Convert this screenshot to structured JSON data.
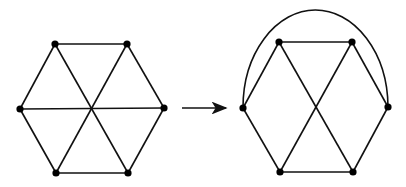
{
  "diagram": {
    "type": "graph-transformation",
    "left_graph": {
      "name": "hexagon-with-diagonals",
      "nodes": [
        {
          "id": "a",
          "x": 55,
          "y": 44
        },
        {
          "id": "b",
          "x": 127,
          "y": 44
        },
        {
          "id": "c",
          "x": 164,
          "y": 108
        },
        {
          "id": "d",
          "x": 128,
          "y": 173
        },
        {
          "id": "e",
          "x": 56,
          "y": 173
        },
        {
          "id": "f",
          "x": 20,
          "y": 109
        }
      ],
      "edges": [
        [
          "a",
          "b"
        ],
        [
          "b",
          "c"
        ],
        [
          "c",
          "d"
        ],
        [
          "d",
          "e"
        ],
        [
          "e",
          "f"
        ],
        [
          "f",
          "a"
        ],
        [
          "a",
          "d"
        ],
        [
          "b",
          "e"
        ],
        [
          "f",
          "c"
        ]
      ]
    },
    "arrow": {
      "x1": 182,
      "y1": 108,
      "x2": 226,
      "y2": 108
    },
    "right_graph": {
      "name": "hexagon-with-cross-and-arc",
      "nodes": [
        {
          "id": "a",
          "x": 279,
          "y": 42
        },
        {
          "id": "b",
          "x": 352,
          "y": 42
        },
        {
          "id": "c",
          "x": 388,
          "y": 107
        },
        {
          "id": "d",
          "x": 353,
          "y": 172
        },
        {
          "id": "e",
          "x": 280,
          "y": 172
        },
        {
          "id": "f",
          "x": 243,
          "y": 108
        }
      ],
      "edges": [
        [
          "a",
          "b"
        ],
        [
          "b",
          "c"
        ],
        [
          "c",
          "d"
        ],
        [
          "d",
          "e"
        ],
        [
          "e",
          "f"
        ],
        [
          "f",
          "a"
        ],
        [
          "a",
          "d"
        ],
        [
          "b",
          "e"
        ]
      ],
      "arc": {
        "from": "f",
        "to": "c",
        "peak_y": 10
      }
    },
    "colors": {
      "line": "#111111",
      "node": "#000000",
      "background": "#ffffff"
    }
  }
}
